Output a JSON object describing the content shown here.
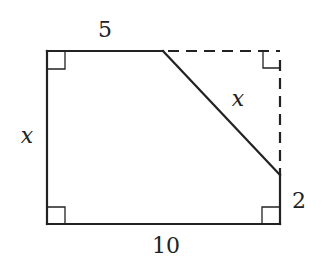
{
  "diagram": {
    "type": "geometry-figure",
    "colors": {
      "stroke": "#222222",
      "background": "#ffffff"
    },
    "labels": {
      "top_segment": "5",
      "left_side": "x",
      "diagonal": "x",
      "bottom_side": "10",
      "right_segment": "2"
    },
    "vertices": {
      "top_left": [
        47,
        51
      ],
      "bottom_left": [
        47,
        224
      ],
      "bottom_right": [
        280,
        224
      ],
      "right_cut_point": [
        280,
        175
      ],
      "top_cut_point": [
        163,
        51
      ],
      "removed_corner": [
        280,
        51
      ]
    },
    "right_angle_marks": [
      "top_left",
      "bottom_left",
      "bottom_right",
      "removed_corner"
    ],
    "dashed_edges": [
      "top_cut_point-removed_corner",
      "removed_corner-right_cut_point"
    ]
  }
}
